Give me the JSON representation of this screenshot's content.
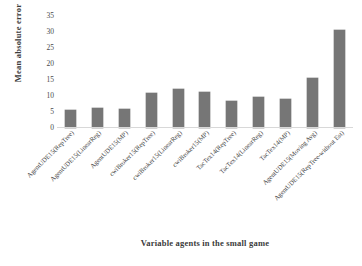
{
  "chart_data": {
    "type": "bar",
    "title": "",
    "subtitle": "",
    "xlabel": "Variable agents in the small game",
    "ylabel": "Mean absolute error",
    "ylim": [
      0,
      35
    ],
    "ytick_step": 5,
    "yticks": [
      "35",
      "30",
      "25",
      "20",
      "15",
      "10",
      "5",
      "0"
    ],
    "grid": false,
    "legend": false,
    "legend_position": "none",
    "bar_color": "#767676",
    "categories": [
      "AgentUDE15(RepTree)",
      "AgentUDE15(LinearReg)",
      "AgentUDE15(MP)",
      "cwiBroker15(RepTree)",
      "cwiBroker15(LinearReg)",
      "cwiBroker15(MP)",
      "TacTex14(RepTree)",
      "TacTex14(LinearReg)",
      "TacTex14(MP)",
      "AgentUDE15(Moving Avg)",
      "AgentUDE15(RepTree-without Est)"
    ],
    "values": [
      5.5,
      6.3,
      5.8,
      11.0,
      12.3,
      11.1,
      8.5,
      9.7,
      9.0,
      15.7,
      30.5
    ]
  }
}
